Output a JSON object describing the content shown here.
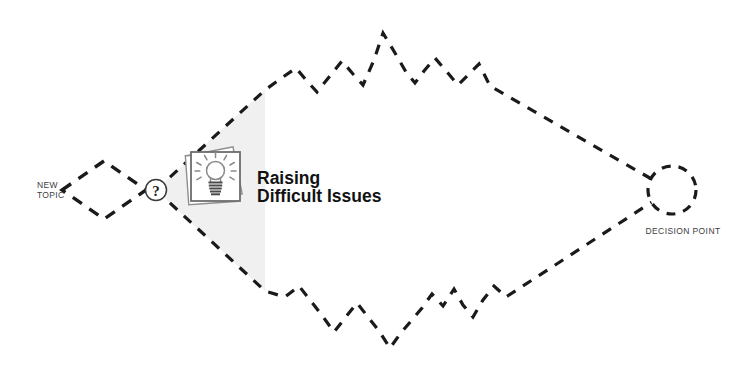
{
  "diagram": {
    "title_line1": "Raising",
    "title_line2": "Difficult Issues",
    "start_label_line1": "NEW",
    "start_label_line2": "TOPIC",
    "question_marker": "?",
    "end_label": "DECISION POINT",
    "icon_name": "lightbulb-cards-icon",
    "colors": {
      "stroke": "#1a1a1a",
      "wedge_fill": "#f0f0f0",
      "title": "#121212",
      "label": "#3d3d3d",
      "card_outline": "#6d6d6d",
      "bulb": "#8a8a8a",
      "background": "#ffffff"
    },
    "nodes": [
      {
        "id": "new-topic",
        "shape": "diamond",
        "label": "NEW TOPIC"
      },
      {
        "id": "question",
        "shape": "circle",
        "label": "?"
      },
      {
        "id": "decision-point",
        "shape": "dashed-circle",
        "label": "DECISION POINT"
      }
    ],
    "paths": [
      {
        "id": "upper-branch",
        "style": "dashed",
        "description": "jagged upper route"
      },
      {
        "id": "lower-branch",
        "style": "dashed",
        "description": "jagged lower route"
      }
    ]
  }
}
